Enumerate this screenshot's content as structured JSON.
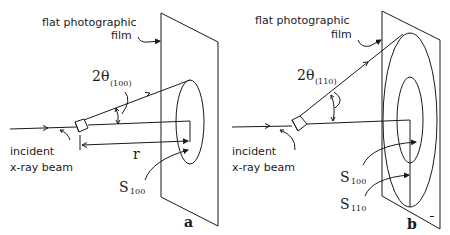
{
  "figure": {
    "panels": [
      {
        "id": "a",
        "panel_label": "a",
        "film_label_line1": "flat photographic",
        "film_label_line2": "film",
        "angle_label_main": "2θ",
        "angle_label_sub": "(100)",
        "beam_label_line1": "incident",
        "beam_label_line2": "x-ray beam",
        "distance_label": "r",
        "ring_labels": [
          {
            "main": "S",
            "sub": "100"
          }
        ]
      },
      {
        "id": "b",
        "panel_label": "b",
        "film_label_line1": "flat photographic",
        "film_label_line2": "film",
        "angle_label_main": "2θ",
        "angle_label_sub": "(110)",
        "beam_label_line1": "incident",
        "beam_label_line2": "x-ray beam",
        "ring_labels": [
          {
            "main": "S",
            "sub": "100"
          },
          {
            "main": "S",
            "sub": "110"
          }
        ],
        "corner_mark": "m"
      }
    ],
    "colors": {
      "ink": "#1a1a1a",
      "background": "#ffffff"
    }
  }
}
